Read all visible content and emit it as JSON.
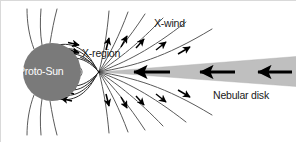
{
  "figure": {
    "background_color": "#ffffff",
    "width": 296,
    "height": 142
  },
  "labels": {
    "proto_sun": "Proto-Sun",
    "x_region": "X-region",
    "x_wind": "X-wind",
    "nebular_disk": "Nebular disk"
  },
  "colors": {
    "star_fill": "#7a7a7a",
    "disk_fill": "#bfbfbf",
    "field_line": "#5a5a5a",
    "arrow_black": "#000000",
    "label_dark": "#1a1a1a",
    "label_light": "#ffffff",
    "background": "#ffffff",
    "border": "#d9d9d9"
  },
  "geometry": {
    "star_center_x": 52,
    "star_center_y": 72,
    "star_radius": 29,
    "x_point_x": 99,
    "x_point_y": 72,
    "disk_right_top_y": 57,
    "disk_right_bottom_y": 86,
    "disk_right_x": 296
  },
  "elements": {
    "star_name": "proto-sun-disk",
    "x_point_name": "x-point",
    "disk_name": "nebular-disk-wedge",
    "field_lines_count": 22,
    "disk_accretion_arrows": 3,
    "wind_arrows": 14
  }
}
